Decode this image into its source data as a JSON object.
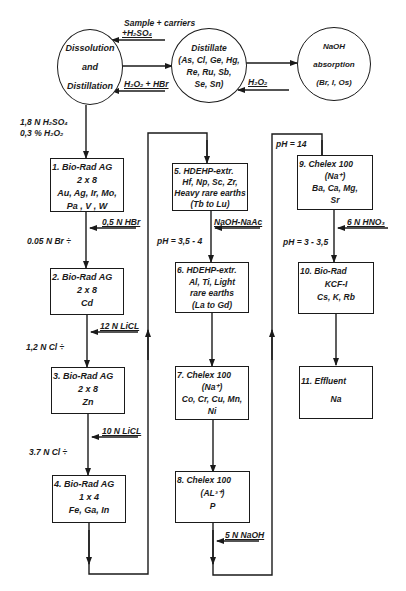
{
  "nodes": {
    "dissolution": {
      "line1": "Dissolution",
      "line2": "and",
      "line3": "Distillation"
    },
    "distillate": {
      "line1": "Distillate",
      "line2": "(As, Cl, Ge, Hg,",
      "line3": "Re, Ru, Sb,",
      "line4": "Se, Sn)"
    },
    "naoh": {
      "line1": "NaOH",
      "line2": "absorption",
      "line3": "(Br, I, Os)"
    },
    "box1": {
      "title": "1. Bio-Rad  AG",
      "line2": "2 x 8",
      "line3": "Au, Ag, Ir, Mo,",
      "line4": "Pa ,  V , W"
    },
    "box2": {
      "title": "2. Bio-Rad  AG",
      "line2": "2 x 8",
      "line3": "Cd"
    },
    "box3": {
      "title": "3. Bio-Rad  AG",
      "line2": "2 x 8",
      "line3": "Zn"
    },
    "box4": {
      "title": "4. Bio-Rad  AG",
      "line2": "1 x 4",
      "line3": "Fe, Ga, In"
    },
    "box5": {
      "title": "5. HDEHP-extr.",
      "line2": "Hf, Np, Sc, Zr,",
      "line3": "Heavy rare earths",
      "line4": "(Tb  to  Lu)"
    },
    "box6": {
      "title": "6. HDEHP-extr.",
      "line2": "Al, Ti, Light",
      "line3": "rare earths",
      "line4": "(La  to  Gd)"
    },
    "box7": {
      "title": "7.  Chelex 100",
      "line2": "(Na⁺)",
      "line3": "Co, Cr, Cu, Mn,",
      "line4": "Ni"
    },
    "box8": {
      "title": "8.  Chelex 100",
      "line2": "(AL³⁺)",
      "line3": "P"
    },
    "box9": {
      "title": "9.  Chelex 100",
      "line2": "(Na⁺)",
      "line3": "Ba,  Ca,  Mg,",
      "line4": "Sr"
    },
    "box10": {
      "title": "10.  Bio-Rad",
      "line2": "KCF-I",
      "line3": "Cs, K, Rb"
    },
    "box11": {
      "title": "11.  Effluent",
      "line2": "Na"
    }
  },
  "labels": {
    "sample_carriers": "Sample + carriers",
    "h2so4_in": "+H₂SO₄",
    "h2o2_hbr": "H₂O₂ + HBr",
    "h2o2": "H₂O₂",
    "acid_1": "1,8  N  H₂SO₄",
    "acid_2": "0,3 %  H₂O₂",
    "hbr_05": "0,5 N  HBr",
    "br_005": "0.05 N  Br ÷",
    "licl_12": "12 N  LiCL",
    "cl_12": "1,2 N  Cl ÷",
    "licl_10": "10 N  LiCL",
    "cl_37": "3.7 N  Cl ÷",
    "naoh_naac": "NaOH-NaAc",
    "ph_35_4": "pH = 3,5 - 4",
    "naoh_5n": "5 N  NaOH",
    "ph_14": "pH = 14",
    "hno3_6n": "6 N  HNO₃",
    "ph_3_35": "pH = 3 - 3,5"
  }
}
